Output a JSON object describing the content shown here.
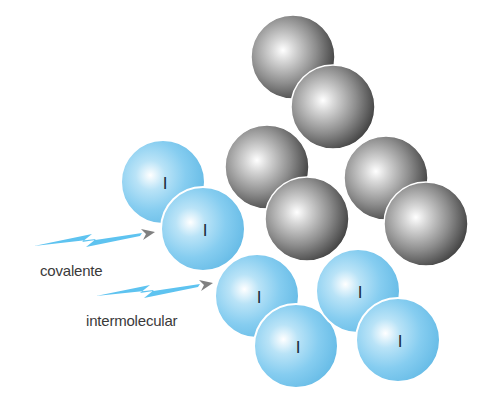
{
  "diagram": {
    "title": "",
    "labels": {
      "covalent": "covalente",
      "intermolecular": "intermolecular"
    },
    "colors": {
      "iodine_sphere": "#7fcbef",
      "iodine_highlight": "#ffffff",
      "iodine_dark": "#5ab6e2",
      "gray_sphere_mid": "#8a8a8a",
      "gray_sphere_dark": "#3a3a3a",
      "arrow_bolt": "#5ec3f0",
      "arrow_head": "#808080",
      "text": "#3a3a3a"
    },
    "iodine_atoms": [
      {
        "symbol": "I",
        "cx": 163,
        "cy": 182,
        "r": 42
      },
      {
        "symbol": "I",
        "cx": 203,
        "cy": 229,
        "r": 42
      },
      {
        "symbol": "I",
        "cx": 257,
        "cy": 296,
        "r": 42
      },
      {
        "symbol": "I",
        "cx": 296,
        "cy": 346,
        "r": 42
      },
      {
        "symbol": "I",
        "cx": 358,
        "cy": 291,
        "r": 42
      },
      {
        "symbol": "I",
        "cx": 398,
        "cy": 340,
        "r": 42
      }
    ],
    "gray_atoms": [
      {
        "cx": 293,
        "cy": 57,
        "r": 42
      },
      {
        "cx": 333,
        "cy": 107,
        "r": 42
      },
      {
        "cx": 267,
        "cy": 167,
        "r": 42
      },
      {
        "cx": 307,
        "cy": 219,
        "r": 42
      },
      {
        "cx": 386,
        "cy": 178,
        "r": 42
      },
      {
        "cx": 426,
        "cy": 224,
        "r": 42
      }
    ],
    "arrows": [
      {
        "name": "covalent-arrow",
        "label_key": "covalent"
      },
      {
        "name": "intermolecular-arrow",
        "label_key": "intermolecular"
      }
    ]
  }
}
